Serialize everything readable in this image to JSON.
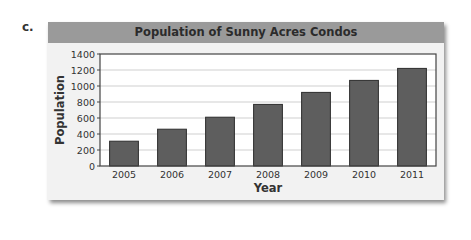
{
  "problem_label": "c.",
  "chart_data": {
    "type": "bar",
    "title": "Population of Sunny Acres Condos",
    "xlabel": "Year",
    "ylabel": "Population",
    "categories": [
      "2005",
      "2006",
      "2007",
      "2008",
      "2009",
      "2010",
      "2011"
    ],
    "values": [
      310,
      460,
      610,
      770,
      920,
      1070,
      1220
    ],
    "ylim": [
      0,
      1400
    ],
    "yticks": [
      0,
      200,
      400,
      600,
      800,
      1000,
      1200,
      1400
    ],
    "grid": true,
    "legend": null,
    "colors": {
      "bar": "#5e5e5e",
      "bar_border": "#2e2e2e",
      "title_bar": "#9a9a9a",
      "frame": "#f2f2f2",
      "plot": "#ffffff",
      "grid": "#cfcfcf"
    }
  }
}
